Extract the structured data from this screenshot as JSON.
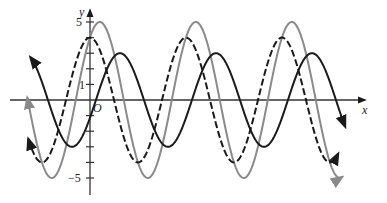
{
  "chart_data": {
    "type": "line",
    "title": "",
    "xlabel": "x",
    "ylabel": "y",
    "origin_label": "O",
    "y_ticks": [
      -5,
      -4,
      -3,
      -2,
      -1,
      1,
      2,
      3,
      4,
      5
    ],
    "y_tick_labels": [
      "5",
      "1",
      "-5"
    ],
    "ylim": [
      -5.5,
      5.8
    ],
    "xlim": [
      -2.0,
      8.6
    ],
    "grid": false,
    "legend": null,
    "period": 3.14159,
    "series": [
      {
        "name": "solid black curve",
        "style": "solid",
        "color": "#1a1a1a",
        "amplitude": 3,
        "formula_hint": "y = 3 sin 2x",
        "peaks_x": [
          0.98,
          4.12,
          7.26
        ]
      },
      {
        "name": "dashed black curve",
        "style": "dashed",
        "color": "#1a1a1a",
        "amplitude": 4,
        "formula_hint": "y = 4 cos 2x",
        "peaks_x": [
          0.0,
          3.14,
          6.28
        ]
      },
      {
        "name": "gray curve",
        "style": "solid",
        "color": "#8a8a8a",
        "amplitude": 5,
        "formula_hint": "y = 3 sin 2x + 4 cos 2x",
        "peaks_x": [
          0.32,
          3.46,
          6.61
        ]
      }
    ]
  },
  "labels": {
    "x_axis": "x",
    "y_axis": "y",
    "origin": "O",
    "y5": "5",
    "y1": "1",
    "yneg5": "−5"
  }
}
